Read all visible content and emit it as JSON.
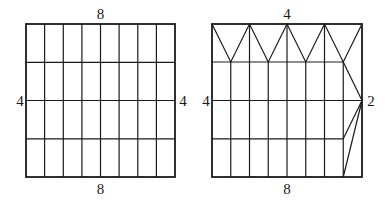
{
  "figures": [
    {
      "id": "rectangle-grid",
      "columns": 8,
      "rows": 4,
      "labels": {
        "top": "8",
        "bottom": "8",
        "left": "4",
        "right": "4"
      }
    },
    {
      "id": "folded-net",
      "columns": 8,
      "rows": 4,
      "labels": {
        "top": "4",
        "bottom": "8",
        "left": "4",
        "right": "2"
      },
      "notes": "Top row replaced by zig-zag triangles (4 peaks along top edge); rightmost column collapsed to a point at mid-height of right edge"
    }
  ],
  "colors": {
    "stroke": "#1a1a1a",
    "background": "#ffffff"
  }
}
